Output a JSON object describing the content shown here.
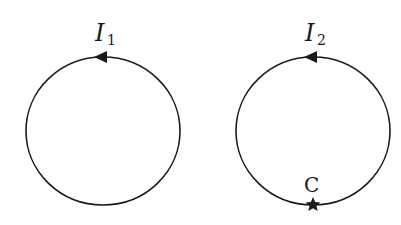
{
  "loops": [
    {
      "id": "loop-1",
      "current_label": "I",
      "current_subscript": "1",
      "direction": "counterclockwise",
      "center": [
        103,
        131
      ],
      "radius": [
        77,
        74
      ]
    },
    {
      "id": "loop-2",
      "current_label": "I",
      "current_subscript": "2",
      "direction": "counterclockwise",
      "center": [
        313,
        131
      ],
      "radius": [
        77,
        74
      ],
      "point_label": "C",
      "point_marker": "star"
    }
  ],
  "colors": {
    "stroke": "#1a1a1a",
    "background": "#ffffff"
  }
}
